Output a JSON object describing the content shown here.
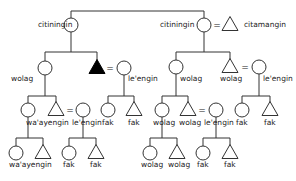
{
  "diagram": {
    "type": "kinship-chart",
    "colors": {
      "line": "#333333",
      "filled": "#000000",
      "background": "#ffffff"
    },
    "nodes": [
      {
        "id": "g1a",
        "shape": "circle",
        "x": 71,
        "y": 25,
        "label": "citiningin",
        "lx": 38,
        "ly": 27
      },
      {
        "id": "g1b",
        "shape": "circle",
        "x": 204,
        "y": 25,
        "label": "citiningin",
        "lx": 160,
        "ly": 27
      },
      {
        "id": "g1c",
        "shape": "triangle",
        "x": 230,
        "y": 24,
        "label": "citamangin",
        "lx": 244,
        "ly": 27
      },
      {
        "id": "g2a",
        "shape": "circle",
        "x": 45,
        "y": 68,
        "label": "wolag",
        "lx": 11,
        "ly": 81
      },
      {
        "id": "g2b",
        "shape": "triangle-filled",
        "x": 97,
        "y": 67,
        "label": "",
        "lx": 0,
        "ly": 0
      },
      {
        "id": "g2c",
        "shape": "circle",
        "x": 124,
        "y": 68,
        "label": "le'engin",
        "lx": 128,
        "ly": 81
      },
      {
        "id": "g2d",
        "shape": "circle",
        "x": 176,
        "y": 67,
        "label": "wolag",
        "lx": 180,
        "ly": 81
      },
      {
        "id": "g2e",
        "shape": "triangle",
        "x": 230,
        "y": 66,
        "label": "wolag",
        "lx": 220,
        "ly": 81
      },
      {
        "id": "g2f",
        "shape": "circle",
        "x": 259,
        "y": 67,
        "label": "le'engin",
        "lx": 263,
        "ly": 81
      },
      {
        "id": "g3a",
        "shape": "circle",
        "x": 28,
        "y": 110,
        "label": "wa'ayengin",
        "lx": 26,
        "ly": 125
      },
      {
        "id": "g3b",
        "shape": "triangle",
        "x": 56,
        "y": 109,
        "label": "",
        "lx": 0,
        "ly": 0
      },
      {
        "id": "g3c",
        "shape": "circle",
        "x": 83,
        "y": 110,
        "label": "le'engin",
        "lx": 72,
        "ly": 125
      },
      {
        "id": "g3d",
        "shape": "circle",
        "x": 108,
        "y": 110,
        "label": "fak",
        "lx": 102,
        "ly": 125
      },
      {
        "id": "g3e",
        "shape": "triangle",
        "x": 134,
        "y": 109,
        "label": "fak",
        "lx": 128,
        "ly": 125
      },
      {
        "id": "g3f",
        "shape": "circle",
        "x": 162,
        "y": 110,
        "label": "wolag",
        "lx": 153,
        "ly": 125
      },
      {
        "id": "g3g",
        "shape": "triangle",
        "x": 188,
        "y": 109,
        "label": "wolag",
        "lx": 179,
        "ly": 125
      },
      {
        "id": "g3h",
        "shape": "circle",
        "x": 216,
        "y": 110,
        "label": "le'engin",
        "lx": 204,
        "ly": 125
      },
      {
        "id": "g3i",
        "shape": "circle",
        "x": 242,
        "y": 110,
        "label": "fak",
        "lx": 236,
        "ly": 125
      },
      {
        "id": "g3j",
        "shape": "triangle",
        "x": 270,
        "y": 109,
        "label": "fak",
        "lx": 264,
        "ly": 125
      },
      {
        "id": "g4a",
        "shape": "circle",
        "x": 16,
        "y": 153,
        "label": "wa'ayengin",
        "lx": 9,
        "ly": 167
      },
      {
        "id": "g4b",
        "shape": "triangle",
        "x": 43,
        "y": 152,
        "label": "",
        "lx": 0,
        "ly": 0
      },
      {
        "id": "g4c",
        "shape": "circle",
        "x": 69,
        "y": 153,
        "label": "fak",
        "lx": 63,
        "ly": 167
      },
      {
        "id": "g4d",
        "shape": "triangle",
        "x": 96,
        "y": 152,
        "label": "fak",
        "lx": 90,
        "ly": 167
      },
      {
        "id": "g4e",
        "shape": "circle",
        "x": 150,
        "y": 153,
        "label": "wolag",
        "lx": 141,
        "ly": 167
      },
      {
        "id": "g4f",
        "shape": "triangle",
        "x": 177,
        "y": 152,
        "label": "wolag",
        "lx": 168,
        "ly": 167
      },
      {
        "id": "g4g",
        "shape": "circle",
        "x": 203,
        "y": 153,
        "label": "fak",
        "lx": 197,
        "ly": 167
      },
      {
        "id": "g4h",
        "shape": "triangle",
        "x": 230,
        "y": 152,
        "label": "fak",
        "lx": 224,
        "ly": 167
      }
    ],
    "marriages": [
      {
        "x": 217,
        "y": 28,
        "label": "="
      },
      {
        "x": 110,
        "y": 71,
        "label": "="
      },
      {
        "x": 245,
        "y": 70,
        "label": "="
      },
      {
        "x": 70,
        "y": 113,
        "label": "="
      },
      {
        "x": 202,
        "y": 113,
        "label": "="
      }
    ],
    "lines": [
      [
        71,
        18,
        71,
        11
      ],
      [
        71,
        11,
        204,
        11
      ],
      [
        204,
        11,
        204,
        18
      ],
      [
        71,
        32,
        71,
        52
      ],
      [
        45,
        52,
        97,
        52
      ],
      [
        45,
        52,
        45,
        61
      ],
      [
        97,
        52,
        97,
        60
      ],
      [
        204,
        32,
        204,
        52
      ],
      [
        176,
        52,
        230,
        52
      ],
      [
        176,
        52,
        176,
        60
      ],
      [
        230,
        52,
        230,
        59
      ],
      [
        45,
        75,
        45,
        96
      ],
      [
        28,
        96,
        56,
        96
      ],
      [
        28,
        96,
        28,
        103
      ],
      [
        56,
        96,
        56,
        102
      ],
      [
        124,
        75,
        124,
        96
      ],
      [
        108,
        96,
        134,
        96
      ],
      [
        108,
        96,
        108,
        103
      ],
      [
        134,
        96,
        134,
        102
      ],
      [
        176,
        74,
        176,
        96
      ],
      [
        162,
        96,
        188,
        96
      ],
      [
        162,
        96,
        162,
        103
      ],
      [
        188,
        96,
        188,
        102
      ],
      [
        259,
        74,
        259,
        96
      ],
      [
        242,
        96,
        270,
        96
      ],
      [
        242,
        96,
        242,
        103
      ],
      [
        270,
        96,
        270,
        102
      ],
      [
        28,
        117,
        28,
        138
      ],
      [
        16,
        138,
        43,
        138
      ],
      [
        16,
        138,
        16,
        146
      ],
      [
        43,
        138,
        43,
        145
      ],
      [
        83,
        117,
        83,
        138
      ],
      [
        69,
        138,
        96,
        138
      ],
      [
        69,
        138,
        69,
        146
      ],
      [
        96,
        138,
        96,
        145
      ],
      [
        162,
        117,
        162,
        138
      ],
      [
        150,
        138,
        177,
        138
      ],
      [
        150,
        138,
        150,
        146
      ],
      [
        177,
        138,
        177,
        145
      ],
      [
        216,
        117,
        216,
        138
      ],
      [
        203,
        138,
        230,
        138
      ],
      [
        203,
        138,
        203,
        146
      ],
      [
        230,
        138,
        230,
        145
      ]
    ]
  }
}
